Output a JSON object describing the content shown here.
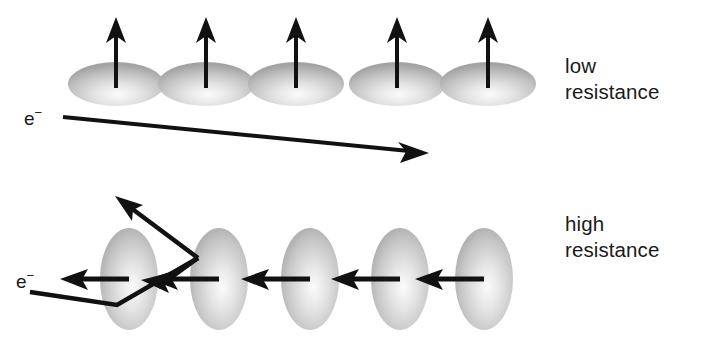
{
  "figure": {
    "background_color": "#ffffff",
    "ink_color": "#111111",
    "domain_fill_light": "#f2f2f2",
    "domain_fill_mid": "#c9c9c9",
    "domain_fill_dark": "#9a9a9a"
  },
  "top_panel": {
    "label_line1": "low",
    "label_line2": "resistance",
    "label_x": 565,
    "label_y1": 73,
    "label_y2": 99,
    "electron_label": "e",
    "electron_superscript": "−",
    "electron_label_x": 24,
    "electron_label_y": 125,
    "domain_count": 5,
    "domain_rx": 48,
    "domain_ry": 22,
    "domain_cy": 84,
    "domain_centers_x": [
      116,
      206,
      296,
      397,
      488
    ],
    "spin_arrow_direction": "up",
    "spin_arrow_tip_y": 19,
    "spin_arrow_base_y": 88,
    "electron_path_start": [
      63,
      117
    ],
    "electron_path_end": [
      427,
      152
    ]
  },
  "bottom_panel": {
    "label_line1": "high",
    "label_line2": "resistance",
    "label_x": 565,
    "label_y1": 231,
    "label_y2": 257,
    "electron_label": "e",
    "electron_superscript": "−",
    "electron_label_x": 16,
    "electron_label_y": 288,
    "domain_count": 5,
    "domain_rx": 29,
    "domain_ry": 51,
    "domain_cy": 279,
    "domain_centers_x": [
      129,
      219,
      310,
      400,
      484
    ],
    "spin_arrow_direction": "left",
    "spin_arrow_axis_y": 279,
    "spin_arrow_tips_x": [
      62,
      152,
      243,
      333
    ],
    "spin_arrow_tails_x": [
      129,
      219,
      310,
      400,
      484
    ],
    "scatter_path_points": [
      [
        30,
        292
      ],
      [
        117,
        305
      ],
      [
        198,
        258
      ],
      [
        117,
        198
      ]
    ],
    "scatter_mid_arrow_tip": [
      145,
      280
    ],
    "scatter_end_arrow_tip": [
      117,
      198
    ]
  }
}
